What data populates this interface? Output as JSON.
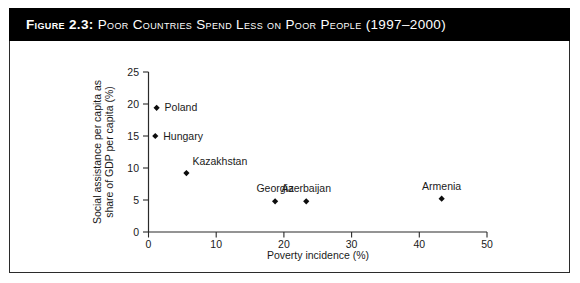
{
  "figure": {
    "number_label": "Figure 2.3:",
    "caption": "Poor Countries Spend Less on Poor People (1997–2000)"
  },
  "chart_data": {
    "type": "scatter",
    "title": "Poor Countries Spend Less on Poor People (1997–2000)",
    "xlabel": "Poverty incidence (%)",
    "ylabel": "Social assistance per capita as share of GDP per capita (%)",
    "ylabel_line1": "Social assistance per capita as",
    "ylabel_line2": "share of GDP per capita (%)",
    "xlim": [
      0,
      50
    ],
    "ylim": [
      0,
      25
    ],
    "xticks": [
      0,
      10,
      20,
      30,
      40,
      50
    ],
    "yticks": [
      0,
      5,
      10,
      15,
      20,
      25
    ],
    "xtick_labels": [
      "0",
      "10",
      "20",
      "30",
      "40",
      "50"
    ],
    "ytick_labels": [
      "0",
      "5",
      "10",
      "15",
      "20",
      "25"
    ],
    "grid": false,
    "legend": "none",
    "marker": "diamond",
    "marker_color": "#0d0d0d",
    "points": [
      {
        "label": "Poland",
        "x": 1.2,
        "y": 19.4,
        "label_pos": "right"
      },
      {
        "label": "Hungary",
        "x": 1.0,
        "y": 15.0,
        "label_pos": "right"
      },
      {
        "label": "Kazakhstan",
        "x": 5.6,
        "y": 9.2,
        "label_pos": "above-right"
      },
      {
        "label": "Georgia",
        "x": 18.7,
        "y": 4.8,
        "label_pos": "above"
      },
      {
        "label": "Azerbaijan",
        "x": 23.3,
        "y": 4.8,
        "label_pos": "above"
      },
      {
        "label": "Armenia",
        "x": 43.3,
        "y": 5.2,
        "label_pos": "above"
      }
    ]
  }
}
